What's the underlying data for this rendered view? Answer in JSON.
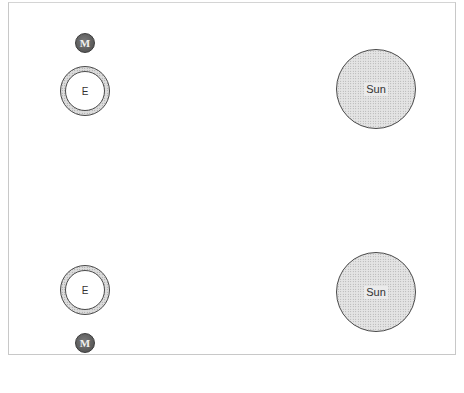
{
  "diagram": {
    "configurations": [
      {
        "position": "top",
        "moon": {
          "label": "M"
        },
        "earth": {
          "label": "E"
        },
        "sun": {
          "label": "Sun"
        }
      },
      {
        "position": "bottom",
        "moon": {
          "label": "M"
        },
        "earth": {
          "label": "E"
        },
        "sun": {
          "label": "Sun"
        }
      }
    ]
  }
}
